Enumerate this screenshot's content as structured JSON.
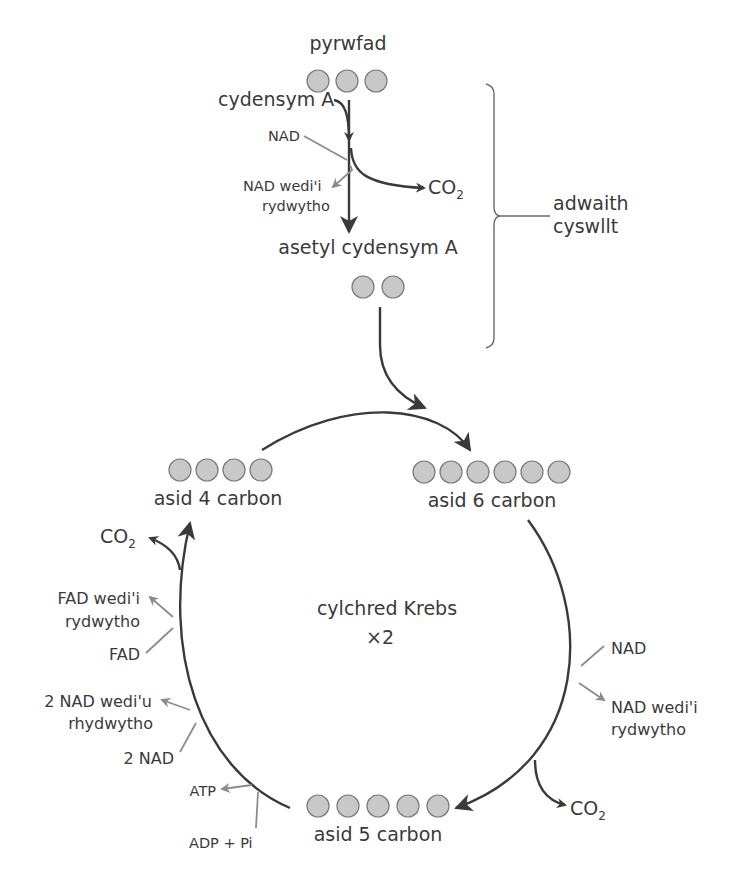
{
  "colors": {
    "background": "#ffffff",
    "main_arrow": "#3a3a3a",
    "side_arrow": "#8c8c8c",
    "atom_fill": "#c8c8c8",
    "atom_stroke": "#7a7a7a",
    "text": "#3a3a3a"
  },
  "link_reaction": {
    "pyruvate_label": "pyrwfad",
    "pyruvate_carbons": 3,
    "coenzyme_a_label": "cydensym A",
    "nad_label": "NAD",
    "reduced_nad_line1": "NAD wedi'i",
    "reduced_nad_line2": "rydwytho",
    "co2_label": "CO",
    "co2_subscript": "2",
    "acetyl_coa_label": "asetyl cydensym A",
    "acetyl_carbons": 2,
    "bracket_label_line1": "adwaith",
    "bracket_label_line2": "cyswllt"
  },
  "krebs_cycle": {
    "center_label_line1": "cylchred Krebs",
    "center_label_line2": "×2",
    "four_carbon": {
      "label": "asid 4 carbon",
      "carbons": 4
    },
    "six_carbon": {
      "label": "asid 6 carbon",
      "carbons": 6
    },
    "five_carbon": {
      "label": "asid 5 carbon",
      "carbons": 5
    },
    "right_side": {
      "nad_label": "NAD",
      "reduced_nad_line1": "NAD wedi'i",
      "reduced_nad_line2": "rydwytho",
      "co2_label": "CO",
      "co2_subscript": "2"
    },
    "left_side": {
      "co2_label": "CO",
      "co2_subscript": "2",
      "reduced_fad_line1": "FAD wedi'i",
      "reduced_fad_line2": "rydwytho",
      "fad_label": "FAD",
      "reduced_2nad_line1": "2 NAD wedi'u",
      "reduced_2nad_line2": "rhydwytho",
      "two_nad_label": "2 NAD",
      "atp_label": "ATP",
      "adp_label": "ADP + Pi"
    }
  }
}
